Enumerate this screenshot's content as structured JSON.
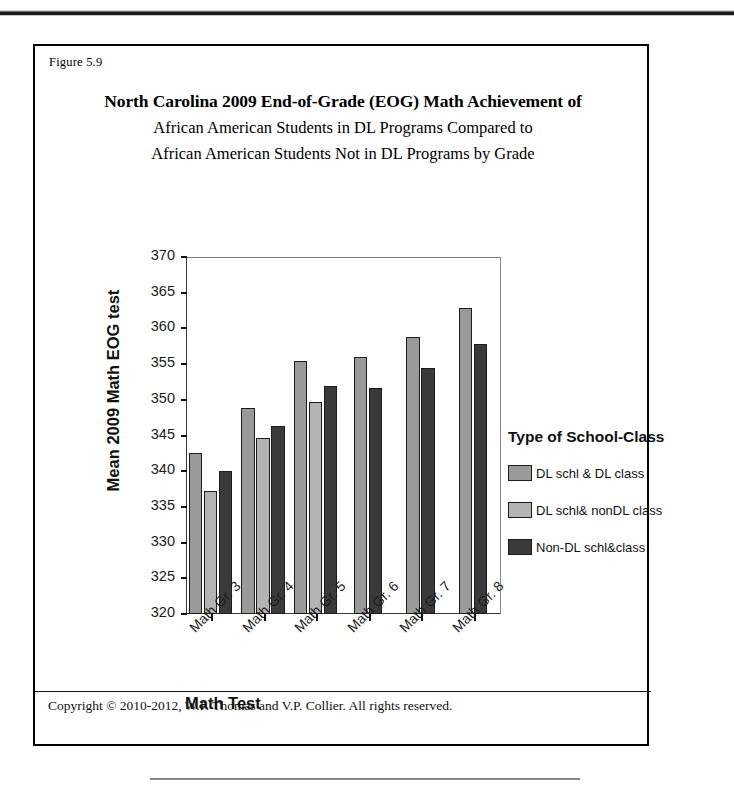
{
  "figure": {
    "number_label": "Figure 5.9",
    "copyright": "Copyright © 2010-2012, W.P. Thomas and V.P. Collier.  All rights reserved."
  },
  "title": {
    "line1": "North Carolina 2009 End-of-Grade (EOG) Math Achievement of",
    "line2": "African American Students in DL Programs Compared to",
    "line3": "African American Students Not in DL Programs by Grade"
  },
  "legend": {
    "title": "Type of School-Class",
    "items": [
      {
        "label": "DL schl & DL class",
        "color": "#9a9a9a"
      },
      {
        "label": "DL schl& nonDL class",
        "color": "#b3b3b3"
      },
      {
        "label": "Non-DL schl&class",
        "color": "#3a3a3a"
      }
    ]
  },
  "chart_data": {
    "type": "bar",
    "title": "North Carolina 2009 End-of-Grade (EOG) Math Achievement of African American Students in DL Programs Compared to African American Students Not in DL Programs by Grade",
    "xlabel": "Math Test",
    "ylabel": "Mean 2009 Math EOG test",
    "ylim": [
      320,
      370
    ],
    "ytick_step": 5,
    "yticks": [
      320,
      325,
      330,
      335,
      340,
      345,
      350,
      355,
      360,
      365,
      370
    ],
    "ytick_labels": [
      "320",
      "325",
      "330",
      "335",
      "340",
      "345",
      "350",
      "355",
      "360",
      "365",
      "370"
    ],
    "grid": false,
    "legend_position": "right",
    "legend_title": "Type of School-Class",
    "categories": [
      "Math Gr. 3",
      "Math Gr. 4",
      "Math Gr. 5",
      "Math Gr. 6",
      "Math Gr. 7",
      "Math Gr. 8"
    ],
    "series": [
      {
        "name": "DL schl & DL class",
        "color": "#9a9a9a",
        "values": [
          342.6,
          348.8,
          355.5,
          356.0,
          358.8,
          362.8
        ]
      },
      {
        "name": "DL schl& nonDL class",
        "color": "#b3b3b3",
        "values": [
          337.2,
          344.6,
          349.7,
          null,
          null,
          null
        ]
      },
      {
        "name": "Non-DL schl&class",
        "color": "#3a3a3a",
        "values": [
          340.1,
          346.3,
          351.9,
          351.6,
          354.5,
          357.8
        ]
      }
    ]
  }
}
